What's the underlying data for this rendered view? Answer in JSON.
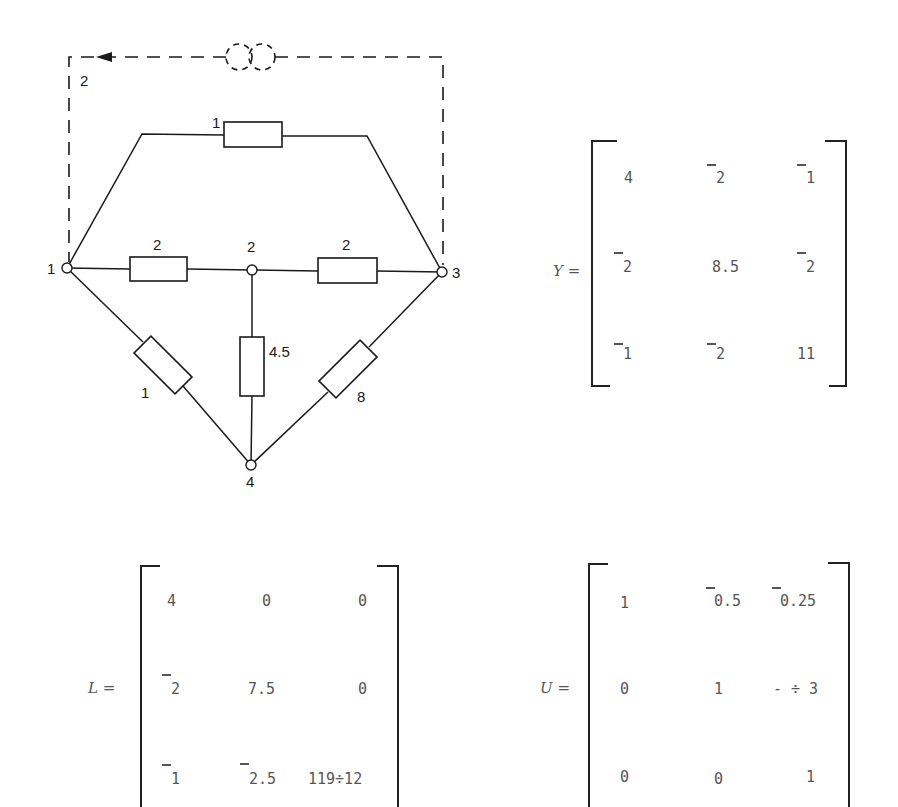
{
  "circuit": {
    "nodes": [
      {
        "id": "1",
        "label": "1"
      },
      {
        "id": "2",
        "label": "2"
      },
      {
        "id": "3",
        "label": "3"
      },
      {
        "id": "4",
        "label": "4"
      }
    ],
    "branches": [
      {
        "from": "1",
        "to": "3",
        "value": "1",
        "label": "1"
      },
      {
        "from": "1",
        "to": "2",
        "value": "2",
        "label": "2"
      },
      {
        "from": "2",
        "to": "3",
        "value": "2",
        "label": "2"
      },
      {
        "from": "2",
        "to": "4",
        "value": "4.5",
        "label": "4.5"
      },
      {
        "from": "1",
        "to": "4",
        "value": "1",
        "label": "1"
      },
      {
        "from": "3",
        "to": "4",
        "value": "8",
        "label": "8"
      }
    ],
    "current_source": {
      "from": "3",
      "to": "1",
      "value": "2",
      "label": "2",
      "style": "dashed"
    }
  },
  "matrices": {
    "Y": {
      "name": "Y",
      "equals": "=",
      "rows": [
        [
          "4",
          "¯2",
          "¯1"
        ],
        [
          "¯2",
          "8.5",
          "¯2"
        ],
        [
          "¯1",
          "¯2",
          "11"
        ]
      ]
    },
    "L": {
      "name": "L",
      "equals": "=",
      "rows": [
        [
          "4",
          "0",
          "0"
        ],
        [
          "¯2",
          "7.5",
          "0"
        ],
        [
          "¯1",
          "¯2.5",
          "119÷12"
        ]
      ]
    },
    "U": {
      "name": "U",
      "equals": "=",
      "rows": [
        [
          "1",
          "¯0.5",
          "¯0.25"
        ],
        [
          "0",
          "1",
          "-÷3"
        ],
        [
          "0",
          "0",
          "1"
        ]
      ]
    }
  },
  "display": {
    "node1": "1",
    "node2": "2",
    "node3": "3",
    "node4": "4",
    "r13": "1",
    "r12": "2",
    "r23": "2",
    "r24": "4.5",
    "r14": "1",
    "r34": "8",
    "src": "2",
    "Y": {
      "name": "Y =",
      "r0c0": "4",
      "r0c1": "2",
      "r0c2": "1",
      "r1c0": "2",
      "r1c1": "8.5",
      "r1c2": "2",
      "r2c0": "1",
      "r2c1": "2",
      "r2c2": "11"
    },
    "L": {
      "name": "L =",
      "r0c0": "4",
      "r0c1": "0",
      "r0c2": "0",
      "r1c0": "2",
      "r1c1": "7.5",
      "r1c2": "0",
      "r2c0": "1",
      "r2c1": "2.5",
      "r2c2": "119÷12"
    },
    "U": {
      "name": "U =",
      "r0c0": "1",
      "r0c1": "0.5",
      "r0c2": "0.25",
      "r1c0": "0",
      "r1c1": "1",
      "r1c2": "- ÷ 3",
      "r2c0": "0",
      "r2c1": "0",
      "r2c2": "1"
    }
  }
}
